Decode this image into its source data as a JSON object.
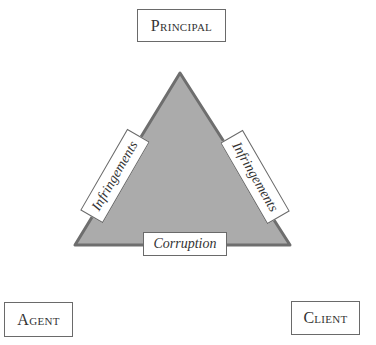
{
  "diagram": {
    "nodes": {
      "top": "Principal",
      "bottom_left": "Agent",
      "bottom_right": "Client"
    },
    "triangle": {
      "fill": "#ababab",
      "stroke": "#6e6e6e",
      "edges": {
        "left": "Infringements",
        "right": "Infringements",
        "bottom": "Corruption"
      }
    }
  }
}
